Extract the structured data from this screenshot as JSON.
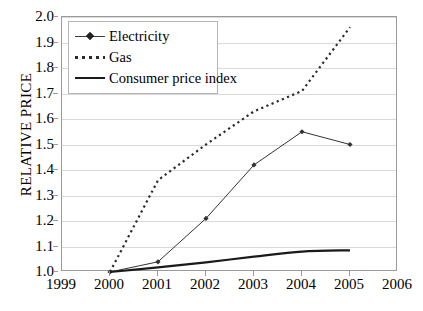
{
  "chart_data": {
    "type": "line",
    "title": "",
    "xlabel": "",
    "ylabel": "RELATIVE PRICE",
    "x": [
      2000,
      2001,
      2002,
      2003,
      2004,
      2005
    ],
    "xticklabels": [
      "1999",
      "2000",
      "2001",
      "2002",
      "2003",
      "2004",
      "2005",
      "2006"
    ],
    "xlim": [
      1999,
      2006
    ],
    "ylim": [
      1.0,
      2.0
    ],
    "yticklabels": [
      "1.0",
      "1.1",
      "1.2",
      "1.3",
      "1.4",
      "1.5",
      "1.6",
      "1.7",
      "1.8",
      "1.9",
      "2.0"
    ],
    "grid": "horizontal",
    "legend_position": "upper-left",
    "series": [
      {
        "name": "Electricity",
        "style": "solid-thin-with-diamond-markers",
        "color": "#333333",
        "values": [
          1.0,
          1.04,
          1.21,
          1.42,
          1.55,
          1.5
        ]
      },
      {
        "name": "Gas",
        "style": "dotted",
        "color": "#2b2b2b",
        "values": [
          1.0,
          1.36,
          1.5,
          1.63,
          1.71,
          1.96
        ]
      },
      {
        "name": "Consumer price index",
        "style": "solid-thick",
        "color": "#1a1a1a",
        "values": [
          1.0,
          1.018,
          1.038,
          1.06,
          1.08,
          1.085
        ]
      }
    ]
  },
  "legend": {
    "items": [
      {
        "label": "Electricity",
        "key": "line-diamond-marker-icon"
      },
      {
        "label": "Gas",
        "key": "dotted-line-icon"
      },
      {
        "label": "Consumer price index",
        "key": "solid-line-icon"
      }
    ]
  }
}
